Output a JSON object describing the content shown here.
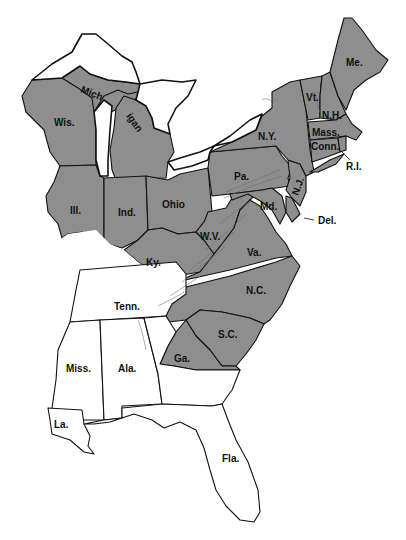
{
  "map": {
    "title": "",
    "colors": {
      "shaded": "#8e8e8e",
      "unshaded": "#ffffff",
      "outline": "#111111"
    },
    "labels": {
      "mich_upper": "Mich",
      "mich_lower": "igan",
      "wis": "Wis.",
      "ill": "Ill.",
      "ind": "Ind.",
      "ohio": "Ohio",
      "ky": "Ky.",
      "wv": "W.V.",
      "va": "Va.",
      "pa": "Pa.",
      "md": "Md.",
      "nj": "N.J.",
      "del": "Del.",
      "ny": "N.Y.",
      "vt": "Vt.",
      "nh": "N.H.",
      "me": "Me.",
      "mass": "Mass.",
      "conn": "Conn.",
      "ri": "R.I.",
      "nc": "N.C.",
      "sc": "S.C.",
      "ga": "Ga.",
      "tenn": "Tenn.",
      "miss": "Miss.",
      "ala": "Ala.",
      "la": "La.",
      "fla": "Fla."
    },
    "shaded_states": [
      "Mich",
      "Wis.",
      "Ill.",
      "Ind.",
      "Ohio",
      "Ky.",
      "W.V.",
      "Va.",
      "Pa.",
      "Md.",
      "N.J.",
      "Del.",
      "N.Y.",
      "Vt.",
      "N.H.",
      "Me.",
      "Mass.",
      "Conn.",
      "R.I.",
      "N.C.",
      "S.C.",
      "Ga. (partial)"
    ],
    "unshaded_states": [
      "Tenn.",
      "Miss.",
      "Ala.",
      "La.",
      "Fla.",
      "Ga. (partial)",
      "Ill. (southern tip)",
      "Ky. (western part)"
    ]
  }
}
